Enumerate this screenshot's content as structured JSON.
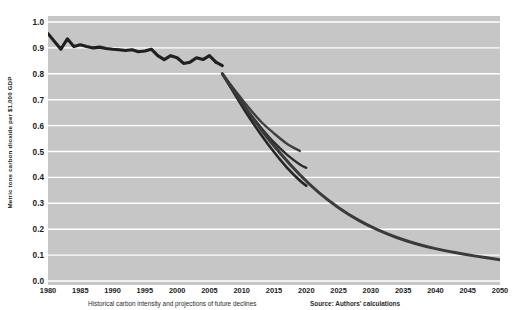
{
  "chart_data": {
    "type": "line",
    "title": "",
    "subtitle": "",
    "xlabel": "",
    "ylabel": "Metric tons carbon dioxide per $1,000 GDP",
    "xlim": [
      1980,
      2050
    ],
    "ylim": [
      0.0,
      1.0
    ],
    "grid": "horizontal",
    "legend_position": "none",
    "background_color": "#c6c6c6",
    "gridline_color": "#ffffff",
    "line_color": "#231f20",
    "yticks": [
      "0.0",
      "0.1",
      "0.2",
      "0.3",
      "0.4",
      "0.5",
      "0.6",
      "0.7",
      "0.8",
      "0.9",
      "1.0"
    ],
    "ytick_values": [
      0.0,
      0.1,
      0.2,
      0.3,
      0.4,
      0.5,
      0.6,
      0.7,
      0.8,
      0.9,
      1.0
    ],
    "xticks": [
      "1980",
      "1985",
      "1990",
      "1995",
      "2000",
      "2005",
      "2010",
      "2015",
      "2020",
      "2025",
      "2030",
      "2035",
      "2040",
      "2045",
      "2050"
    ],
    "xtick_values": [
      1980,
      1985,
      1990,
      1995,
      2000,
      2005,
      2010,
      2015,
      2020,
      2025,
      2030,
      2035,
      2040,
      2045,
      2050
    ],
    "series": [
      {
        "name": "Historical carbon intensity",
        "kind": "historical",
        "color": "#231f20",
        "width": 3.1,
        "x": [
          1980,
          1981,
          1982,
          1983,
          1984,
          1985,
          1986,
          1987,
          1988,
          1989,
          1990,
          1991,
          1992,
          1993,
          1994,
          1995,
          1996,
          1997,
          1998,
          1999,
          2000,
          2001,
          2002,
          2003,
          2004,
          2005,
          2006
        ],
        "values": [
          0.955,
          0.925,
          0.895,
          0.935,
          0.905,
          0.912,
          0.905,
          0.9,
          0.903,
          0.898,
          0.895,
          0.893,
          0.89,
          0.893,
          0.885,
          0.888,
          0.895,
          0.87,
          0.855,
          0.87,
          0.862,
          0.84,
          0.845,
          0.862,
          0.855,
          0.87,
          0.845
        ]
      },
      {
        "name": "Historical tail",
        "kind": "historical",
        "color": "#231f20",
        "width": 3.1,
        "x": [
          2006,
          2007
        ],
        "values": [
          0.845,
          0.832
        ]
      },
      {
        "name": "Projection high",
        "kind": "projection",
        "color": "#3f3f3f",
        "width": 2.4,
        "x": [
          2007,
          2009,
          2011,
          2013,
          2015,
          2017,
          2019
        ],
        "values": [
          0.8,
          0.735,
          0.672,
          0.615,
          0.57,
          0.53,
          0.502
        ]
      },
      {
        "name": "Projection middle",
        "kind": "projection",
        "color": "#2e2e2e",
        "width": 2.4,
        "x": [
          2007,
          2009,
          2011,
          2013,
          2015,
          2017,
          2019,
          2020
        ],
        "values": [
          0.8,
          0.728,
          0.655,
          0.592,
          0.535,
          0.488,
          0.45,
          0.437
        ]
      },
      {
        "name": "Projection low",
        "kind": "projection",
        "color": "#262626",
        "width": 2.6,
        "x": [
          2007,
          2009,
          2011,
          2013,
          2015,
          2017,
          2019,
          2020
        ],
        "values": [
          0.8,
          0.718,
          0.638,
          0.565,
          0.498,
          0.438,
          0.388,
          0.368
        ]
      },
      {
        "name": "Long-run projection to 2050",
        "kind": "projection",
        "color": "#3a3a3a",
        "width": 3.0,
        "x": [
          2007,
          2010,
          2013,
          2016,
          2019,
          2022,
          2025,
          2028,
          2031,
          2034,
          2037,
          2040,
          2043,
          2046,
          2050
        ],
        "values": [
          0.8,
          0.69,
          0.585,
          0.492,
          0.41,
          0.34,
          0.283,
          0.236,
          0.198,
          0.168,
          0.144,
          0.125,
          0.11,
          0.097,
          0.082
        ]
      }
    ]
  },
  "footer": {
    "note": "Historical carbon intensity and projections of future declines",
    "source": "Source: Authors' calculations"
  }
}
